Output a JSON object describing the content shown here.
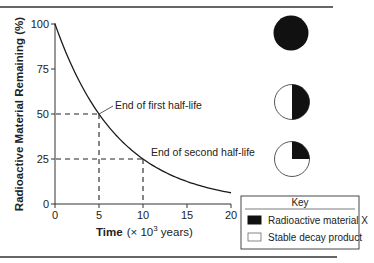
{
  "chart_data": {
    "type": "line",
    "title": "",
    "xlabel": "Time (× 10³ years)",
    "xlabel_bold": "Time",
    "xlabel_rest": "(× 10",
    "xlabel_exp": "3",
    "xlabel_tail": " years)",
    "ylabel": "Radioactive Material Remaining (%)",
    "xlim": [
      0,
      20
    ],
    "ylim": [
      0,
      100
    ],
    "xticks": [
      "0",
      "5",
      "10",
      "15",
      "20"
    ],
    "yticks": [
      "0",
      "25",
      "50",
      "75",
      "100"
    ],
    "grid": false,
    "series": [
      {
        "name": "Radioactive material remaining",
        "x": [
          0,
          1,
          2,
          3,
          4,
          5,
          6,
          7,
          8,
          9,
          10,
          11,
          12,
          13,
          14,
          15,
          16,
          17,
          18,
          19,
          20
        ],
        "values": [
          100,
          87,
          76,
          66,
          57,
          50,
          44,
          38,
          33,
          29,
          25,
          22,
          19,
          16.5,
          14.5,
          12.5,
          11,
          9.5,
          8,
          7,
          6
        ]
      }
    ],
    "annotations": [
      {
        "text": "End of first half-life",
        "x": 5,
        "y": 50
      },
      {
        "text": "End of second half-life",
        "x": 10,
        "y": 25
      }
    ],
    "reference_lines": [
      {
        "from": [
          0,
          50
        ],
        "to": [
          5,
          50
        ],
        "style": "dashed"
      },
      {
        "from": [
          5,
          50
        ],
        "to": [
          5,
          0
        ],
        "style": "dashed"
      },
      {
        "from": [
          0,
          25
        ],
        "to": [
          10,
          25
        ],
        "style": "dashed"
      },
      {
        "from": [
          10,
          25
        ],
        "to": [
          10,
          0
        ],
        "style": "dashed"
      }
    ],
    "pie_icons": [
      {
        "label": "start",
        "radioactive_fraction": 1.0
      },
      {
        "label": "after first half-life",
        "radioactive_fraction": 0.5
      },
      {
        "label": "after second half-life",
        "radioactive_fraction": 0.25
      }
    ],
    "legend": {
      "title": "Key",
      "position": "bottom-right",
      "entries": [
        {
          "label": "Radioactive material X",
          "color": "#111111"
        },
        {
          "label": "Stable decay product",
          "color": "#ffffff"
        }
      ]
    }
  }
}
